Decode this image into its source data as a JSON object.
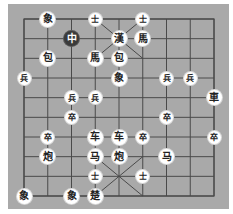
{
  "board": {
    "columns": 9,
    "rows": 10,
    "grid_origin": [
      24,
      19
    ],
    "grid_size": [
      190,
      177
    ],
    "background_color": "#a9a9a9",
    "line_color": "#4a4a4a"
  },
  "pieces": [
    {
      "side": "top",
      "label": "象",
      "col": 1,
      "row": 0
    },
    {
      "side": "top",
      "label": "士",
      "col": 3,
      "row": 0,
      "small": true
    },
    {
      "side": "top",
      "label": "士",
      "col": 5,
      "row": 0,
      "small": true
    },
    {
      "side": "top",
      "label": "中",
      "col": 2,
      "row": 1,
      "dark": true
    },
    {
      "side": "top",
      "label": "漢",
      "col": 4,
      "row": 1
    },
    {
      "side": "top",
      "label": "馬",
      "col": 5,
      "row": 1
    },
    {
      "side": "top",
      "label": "包",
      "col": 1,
      "row": 2
    },
    {
      "side": "top",
      "label": "馬",
      "col": 3,
      "row": 2
    },
    {
      "side": "top",
      "label": "包",
      "col": 4,
      "row": 2
    },
    {
      "side": "top",
      "label": "兵",
      "col": 0,
      "row": 3,
      "small": true
    },
    {
      "side": "top",
      "label": "象",
      "col": 4,
      "row": 3
    },
    {
      "side": "top",
      "label": "兵",
      "col": 6,
      "row": 3,
      "small": true
    },
    {
      "side": "top",
      "label": "兵",
      "col": 7,
      "row": 3,
      "small": true
    },
    {
      "side": "top",
      "label": "兵",
      "col": 2,
      "row": 4,
      "small": true
    },
    {
      "side": "top",
      "label": "兵",
      "col": 3,
      "row": 4,
      "small": true
    },
    {
      "side": "top",
      "label": "車",
      "col": 8,
      "row": 4
    },
    {
      "side": "bottom",
      "label": "卒",
      "col": 2,
      "row": 5,
      "small": true
    },
    {
      "side": "bottom",
      "label": "卒",
      "col": 6,
      "row": 5,
      "small": true
    },
    {
      "side": "bottom",
      "label": "卒",
      "col": 1,
      "row": 6,
      "small": true
    },
    {
      "side": "bottom",
      "label": "车",
      "col": 3,
      "row": 6
    },
    {
      "side": "bottom",
      "label": "车",
      "col": 4,
      "row": 6
    },
    {
      "side": "bottom",
      "label": "卒",
      "col": 5,
      "row": 6,
      "small": true
    },
    {
      "side": "bottom",
      "label": "卒",
      "col": 8,
      "row": 6,
      "small": true
    },
    {
      "side": "bottom",
      "label": "炮",
      "col": 1,
      "row": 7
    },
    {
      "side": "bottom",
      "label": "马",
      "col": 3,
      "row": 7
    },
    {
      "side": "bottom",
      "label": "炮",
      "col": 4,
      "row": 7
    },
    {
      "side": "bottom",
      "label": "马",
      "col": 6,
      "row": 7
    },
    {
      "side": "bottom",
      "label": "士",
      "col": 3,
      "row": 8,
      "small": true
    },
    {
      "side": "bottom",
      "label": "士",
      "col": 5,
      "row": 8,
      "small": true
    },
    {
      "side": "bottom",
      "label": "象",
      "col": 0,
      "row": 9
    },
    {
      "side": "bottom",
      "label": "象",
      "col": 2,
      "row": 9
    },
    {
      "side": "bottom",
      "label": "楚",
      "col": 3,
      "row": 9
    }
  ]
}
